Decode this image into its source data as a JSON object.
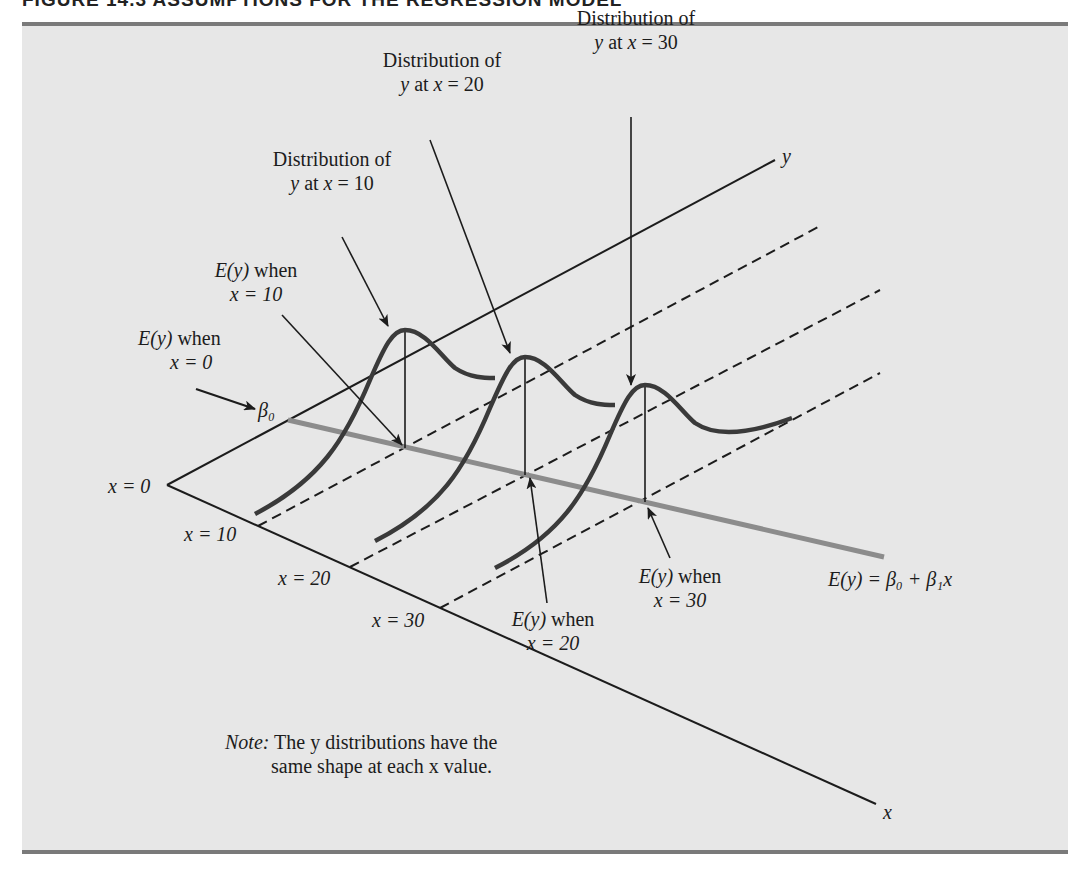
{
  "figure": {
    "title": "FIGURE 14.3   ASSUMPTIONS FOR THE REGRESSION MODEL"
  },
  "axes": {
    "y_axis_label": "y",
    "x_axis_label": "x",
    "origin_label": "x = 0",
    "x_ticks": [
      "x = 10",
      "x = 20",
      "x = 30"
    ]
  },
  "annotations": {
    "dist_x10": {
      "line1": "Distribution of",
      "line2_pre": "y",
      "line2_mid": " at ",
      "line2_var": "x",
      "line2_post": " = 10"
    },
    "dist_x20": {
      "line1": "Distribution of",
      "line2_pre": "y",
      "line2_mid": " at ",
      "line2_var": "x",
      "line2_post": " = 20"
    },
    "dist_x30": {
      "line1": "Distribution of",
      "line2_pre": "y",
      "line2_mid": " at ",
      "line2_var": "x",
      "line2_post": " = 30"
    },
    "ey_x0": {
      "line1_func": "E(y)",
      "line1_rest": " when",
      "line2": "x = 0"
    },
    "ey_x10": {
      "line1_func": "E(y)",
      "line1_rest": " when",
      "line2": "x = 10"
    },
    "ey_x20": {
      "line1_func": "E(y)",
      "line1_rest": " when",
      "line2": "x = 20"
    },
    "ey_x30": {
      "line1_func": "E(y)",
      "line1_rest": " when",
      "line2": "x = 30"
    },
    "beta0": "β₀",
    "regression_equation": "E(y) = β₀ + β₁x"
  },
  "note": {
    "label": "Note:",
    "line1": " The y distributions have the",
    "line2": "same shape at each x value."
  },
  "colors": {
    "panel_bg": "#e7e7e7",
    "rule": "#7a7a7a",
    "regression_line": "#8c8c8c",
    "curve": "#3a3a3a",
    "ink": "#1c1c1c"
  }
}
